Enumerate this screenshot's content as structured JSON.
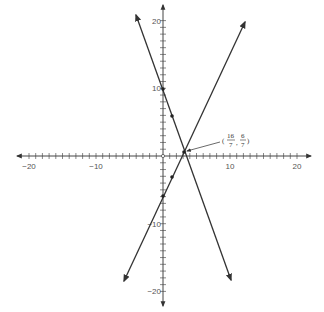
{
  "chart_data": {
    "type": "line",
    "title": "",
    "xlabel": "",
    "ylabel": "",
    "xlim": [
      -20,
      20
    ],
    "ylim": [
      -20,
      20
    ],
    "grid": false,
    "x_ticks_labeled": [
      "-20",
      "-10",
      "10",
      "20"
    ],
    "y_ticks_labeled": [
      "20",
      "10",
      "-10",
      "-20"
    ],
    "minor_tick_step": 1,
    "series": [
      {
        "name": "line-1",
        "equation": "y = -4x + 10",
        "points_marked": [
          [
            0,
            10
          ],
          [
            1,
            6
          ]
        ],
        "extent_x": [
          -4,
          10
        ]
      },
      {
        "name": "line-2",
        "equation": "y = 3x - 6",
        "points_marked": [
          [
            0,
            -6
          ],
          [
            1,
            -3
          ]
        ],
        "extent_x": [
          -6,
          12
        ]
      }
    ],
    "annotations": [
      {
        "text": "(16/7, 6/7)",
        "numerator_x": "16",
        "denominator_x": "7",
        "numerator_y": "6",
        "denominator_y": "7",
        "point": [
          2.2857,
          0.8571
        ]
      }
    ],
    "origin_marker": "open-circle"
  },
  "axis": {
    "x_labels": [
      {
        "value": -20,
        "text": "−20"
      },
      {
        "value": -10,
        "text": "−10"
      },
      {
        "value": 10,
        "text": "10"
      },
      {
        "value": 20,
        "text": "20"
      }
    ],
    "y_labels": [
      {
        "value": 20,
        "text": "20"
      },
      {
        "value": 10,
        "text": "10"
      },
      {
        "value": -10,
        "text": "−10"
      },
      {
        "value": -20,
        "text": "−20"
      }
    ]
  },
  "colors": {
    "axis": "#444444",
    "line": "#333333",
    "label": "#555555"
  }
}
